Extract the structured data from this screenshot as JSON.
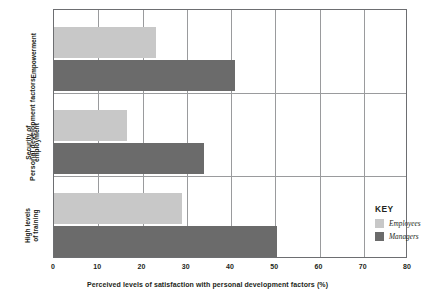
{
  "chart_data": {
    "type": "bar",
    "orientation": "horizontal",
    "title": "",
    "xlabel": "Perceived levels of satisfaction with personal development factors (%)",
    "ylabel": "Personal development factors",
    "categories": [
      "Empowerment",
      "Security of employment",
      "High levels of training"
    ],
    "category_lines": [
      [
        "Empowerment"
      ],
      [
        "Security of",
        "employment"
      ],
      [
        "High levels",
        "of training"
      ]
    ],
    "series": [
      {
        "name": "Employees",
        "color": "#c8c8c8",
        "values": [
          23,
          16.5,
          29
        ]
      },
      {
        "name": "Managers",
        "color": "#6b6b6b",
        "values": [
          41,
          34,
          50.5
        ]
      }
    ],
    "xlim": [
      0,
      80
    ],
    "xticks": [
      0,
      10,
      20,
      30,
      40,
      50,
      60,
      70,
      80
    ],
    "xtick_labels": [
      "0",
      "10",
      "20",
      "30",
      "40",
      "50",
      "60",
      "70",
      "80"
    ],
    "grid": true,
    "grid_axis": "both",
    "legend_position": "inside-bottom-right"
  },
  "legend": {
    "title": "KEY",
    "entries": [
      {
        "label": "Employees",
        "color": "#c8c8c8"
      },
      {
        "label": "Managers",
        "color": "#6b6b6b"
      }
    ]
  },
  "colors": {
    "employees": "#c8c8c8",
    "managers": "#6b6b6b",
    "axis": "#6d6e71",
    "gridline": "#9a9b9d",
    "text": "#231f20",
    "background": "#ffffff"
  }
}
